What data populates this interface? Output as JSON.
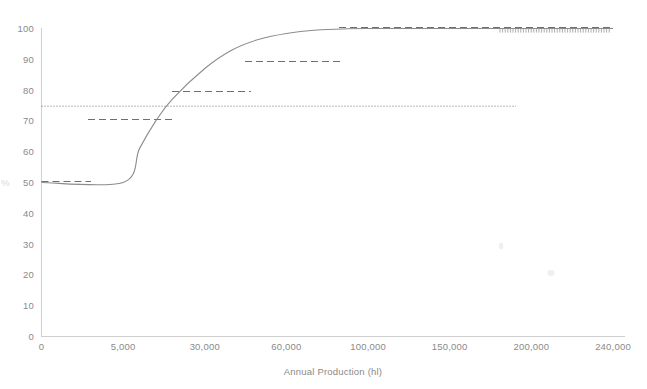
{
  "chart_data": {
    "type": "line",
    "title": "",
    "xlabel": "Annual Production (hl)",
    "ylabel": "%",
    "grid": false,
    "legend": "none",
    "x_tick_labels": [
      "0",
      "5,000",
      "30,000",
      "60,000",
      "100,000",
      "150,000",
      "200,000",
      "240,000"
    ],
    "x_tick_values": [
      0,
      5000,
      30000,
      60000,
      100000,
      150000,
      200000,
      240000
    ],
    "y_tick_labels": [
      "0",
      "10",
      "20",
      "30",
      "40",
      "50",
      "60",
      "70",
      "80",
      "90",
      "100"
    ],
    "y_tick_values": [
      0,
      10,
      20,
      30,
      40,
      50,
      60,
      70,
      80,
      90,
      100
    ],
    "ylim": [
      0,
      103
    ],
    "series": [
      {
        "name": "excise-duty-rate-curve",
        "style": "solid",
        "color": "#8c8c8c",
        "x": [
          0,
          5000,
          10000,
          15000,
          20000,
          30000,
          40000,
          50000,
          60000,
          75000,
          90000,
          100000,
          120000,
          150000,
          180000,
          200000,
          220000,
          240000
        ],
        "y": [
          50,
          50,
          61,
          70,
          77,
          87,
          93,
          96.5,
          98.4,
          99.5,
          99.9,
          100,
          100,
          100,
          100,
          100,
          100,
          100
        ]
      },
      {
        "name": "reference-threshold-dotted",
        "style": "dotted",
        "color": "#6f6f6f",
        "level": 75,
        "x_start": 0,
        "x_end": 240000
      },
      {
        "name": "band-step-50",
        "style": "dashed",
        "color": "#6f6f6f",
        "level": 50,
        "x_start": 0,
        "x_end": 5000
      },
      {
        "name": "band-step-71",
        "style": "dashed",
        "color": "#6f6f6f",
        "level": 71,
        "x_start": 5000,
        "x_end": 30000
      },
      {
        "name": "band-step-80",
        "style": "dashed",
        "color": "#6f6f6f",
        "level": 80.5,
        "x_start": 30000,
        "x_end": 60000
      },
      {
        "name": "band-step-90",
        "style": "dashed",
        "color": "#6f6f6f",
        "level": 90,
        "x_start": 60000,
        "x_end": 100000
      },
      {
        "name": "band-step-101",
        "style": "dashed",
        "color": "#6f6f6f",
        "level": 101,
        "x_start": 100000,
        "x_end": 240000
      }
    ]
  }
}
